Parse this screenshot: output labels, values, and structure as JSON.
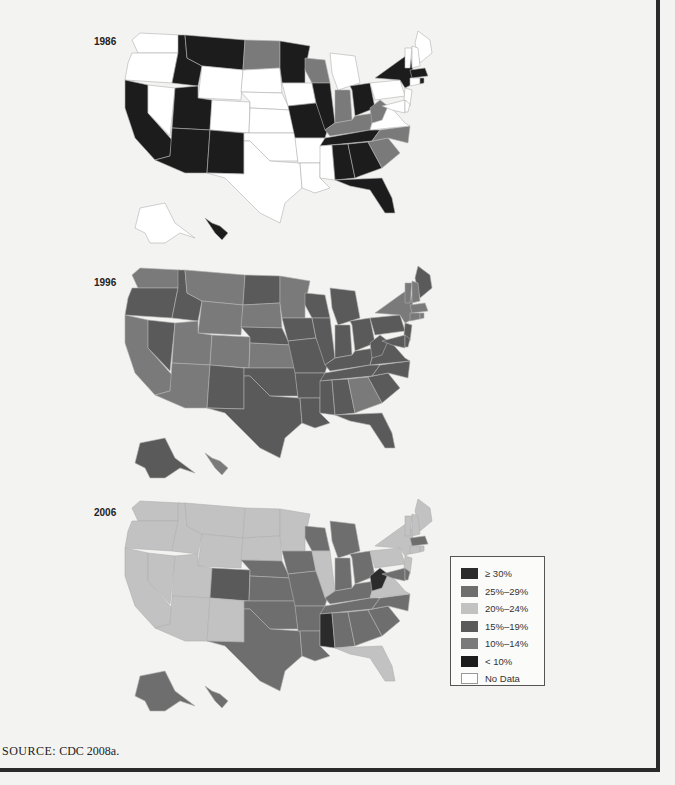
{
  "figure": {
    "source_prefix": "SOURCE:",
    "source_text": "CDC 2008a."
  },
  "legend": {
    "items": [
      {
        "key": "c30",
        "label": "≥ 30%",
        "color": "#2b2b2b"
      },
      {
        "key": "c25",
        "label": "25%–29%",
        "color": "#6e6e6e"
      },
      {
        "key": "c20",
        "label": "20%–24%",
        "color": "#c2c2c2"
      },
      {
        "key": "c15",
        "label": "15%–19%",
        "color": "#5a5a5a"
      },
      {
        "key": "c10",
        "label": "10%–14%",
        "color": "#7a7a7a"
      },
      {
        "key": "lt10",
        "label": "< 10%",
        "color": "#1c1c1c"
      },
      {
        "key": "nd",
        "label": "No Data",
        "color": "#ffffff"
      }
    ]
  },
  "chart_data": {
    "type": "choropleth",
    "title": "",
    "legend_position": "right, beside 2006 map",
    "categories": [
      "≥ 30%",
      "25%–29%",
      "20%–24%",
      "15%–19%",
      "10%–14%",
      "< 10%",
      "No Data"
    ],
    "maps": [
      {
        "year": "1986",
        "states": {
          "WA": "nd",
          "OR": "nd",
          "CA": "lt10",
          "NV": "nd",
          "ID": "lt10",
          "MT": "lt10",
          "WY": "nd",
          "UT": "lt10",
          "AZ": "lt10",
          "CO": "nd",
          "NM": "lt10",
          "ND": "c10",
          "SD": "nd",
          "NE": "nd",
          "KS": "nd",
          "OK": "nd",
          "TX": "nd",
          "MN": "lt10",
          "IA": "nd",
          "MO": "lt10",
          "AR": "nd",
          "LA": "nd",
          "WI": "c10",
          "IL": "lt10",
          "MI": "nd",
          "IN": "c10",
          "OH": "lt10",
          "KY": "c10",
          "TN": "lt10",
          "MS": "nd",
          "AL": "lt10",
          "GA": "lt10",
          "FL": "lt10",
          "SC": "c10",
          "NC": "c10",
          "VA": "nd",
          "WV": "c10",
          "PA": "nd",
          "NY": "lt10",
          "ME": "nd",
          "VT": "nd",
          "NH": "nd",
          "MA": "lt10",
          "CT": "nd",
          "NJ": "nd",
          "MD": "nd",
          "DE": "nd",
          "RI": "lt10",
          "AK": "nd",
          "HI": "lt10"
        }
      },
      {
        "year": "1996",
        "states": {
          "WA": "c10",
          "OR": "c15",
          "CA": "c10",
          "NV": "c15",
          "ID": "c15",
          "MT": "c10",
          "WY": "c10",
          "UT": "c10",
          "AZ": "c10",
          "CO": "c10",
          "NM": "c15",
          "ND": "c15",
          "SD": "c10",
          "NE": "c15",
          "KS": "c10",
          "OK": "c15",
          "TX": "c15",
          "MN": "c10",
          "IA": "c15",
          "MO": "c15",
          "AR": "c15",
          "LA": "c15",
          "WI": "c15",
          "IL": "c15",
          "MI": "c15",
          "IN": "c15",
          "OH": "c15",
          "KY": "c15",
          "TN": "c15",
          "MS": "c15",
          "AL": "c15",
          "GA": "c10",
          "FL": "c15",
          "SC": "c15",
          "NC": "c15",
          "VA": "c15",
          "WV": "c15",
          "PA": "c15",
          "NY": "c10",
          "ME": "c15",
          "VT": "c10",
          "NH": "c10",
          "MA": "c10",
          "CT": "c10",
          "NJ": "c15",
          "MD": "c15",
          "DE": "c15",
          "RI": "c10",
          "AK": "c15",
          "HI": "c10"
        }
      },
      {
        "year": "2006",
        "states": {
          "WA": "c20",
          "OR": "c20",
          "CA": "c20",
          "NV": "c20",
          "ID": "c20",
          "MT": "c20",
          "WY": "c20",
          "UT": "c20",
          "AZ": "c20",
          "CO": "c15",
          "NM": "c20",
          "ND": "c20",
          "SD": "c20",
          "NE": "c25",
          "KS": "c25",
          "OK": "c25",
          "TX": "c25",
          "MN": "c20",
          "IA": "c25",
          "MO": "c25",
          "AR": "c25",
          "LA": "c25",
          "WI": "c25",
          "IL": "c20",
          "MI": "c25",
          "IN": "c25",
          "OH": "c25",
          "KY": "c25",
          "TN": "c25",
          "MS": "c30",
          "AL": "c25",
          "GA": "c25",
          "FL": "c20",
          "SC": "c25",
          "NC": "c25",
          "VA": "c20",
          "WV": "c30",
          "PA": "c20",
          "NY": "c20",
          "ME": "c20",
          "VT": "c20",
          "NH": "c20",
          "MA": "c25",
          "CT": "c20",
          "NJ": "c20",
          "MD": "c25",
          "DE": "c25",
          "RI": "c20",
          "AK": "c25",
          "HI": "c25"
        }
      }
    ]
  }
}
